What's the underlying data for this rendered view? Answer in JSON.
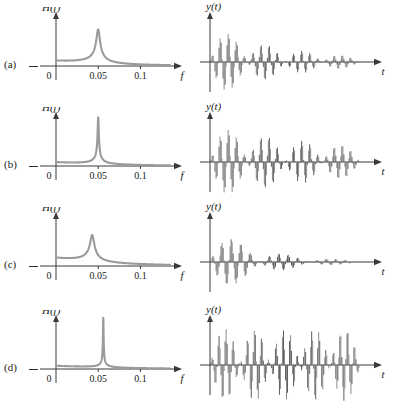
{
  "figure": {
    "row_labels": [
      "(a)",
      "(b)",
      "(c)",
      "(d)"
    ],
    "left_axis": {
      "y_label": "H(f)",
      "x_label": "f",
      "ticks": [
        {
          "value": 0,
          "label": "0"
        },
        {
          "value": 0.05,
          "label": "0.05"
        },
        {
          "value": 0.1,
          "label": "0.1"
        }
      ],
      "xlim": [
        0,
        0.135
      ]
    },
    "right_axis": {
      "y_label": "y(t)",
      "x_label": "t",
      "ticks": []
    }
  },
  "chart_data": [
    {
      "type": "line",
      "panel": "a-left",
      "title": "H(f)",
      "xlabel": "f",
      "ylabel": "H(f)",
      "xlim": [
        0,
        0.135
      ],
      "ylim": [
        0,
        1.15
      ],
      "grid": false,
      "legend": "none",
      "resonance_frequency": 0.05,
      "peak_height": 0.78,
      "peak_sharpness_q": 12,
      "baseline": 0.06,
      "annotation": "moderately sharp resonance peak at f = 0.05"
    },
    {
      "type": "line",
      "panel": "a-right",
      "title": "y(t)",
      "xlabel": "t",
      "ylabel": "y(t)",
      "plot_style": "stem",
      "grid": false,
      "legend": "none",
      "beat_count": 4,
      "decay": "fast",
      "annotation": "damped beating oscillation, amplitude decays over four beats"
    },
    {
      "type": "line",
      "panel": "b-left",
      "title": "H(f)",
      "xlabel": "f",
      "ylabel": "H(f)",
      "xlim": [
        0,
        0.135
      ],
      "ylim": [
        0,
        1.15
      ],
      "grid": false,
      "legend": "none",
      "resonance_frequency": 0.05,
      "peak_height": 1.05,
      "peak_sharpness_q": 38,
      "baseline": 0.06,
      "annotation": "sharp tall resonance peak at f = 0.05, clipped at top of axes"
    },
    {
      "type": "line",
      "panel": "b-right",
      "title": "y(t)",
      "xlabel": "t",
      "ylabel": "y(t)",
      "plot_style": "stem",
      "grid": false,
      "legend": "none",
      "beat_count": 4,
      "decay": "slow",
      "annotation": "lightly damped beating oscillation, slow amplitude decay"
    },
    {
      "type": "line",
      "panel": "c-left",
      "title": "H(f)",
      "xlabel": "f",
      "ylabel": "H(f)",
      "xlim": [
        0,
        0.135
      ],
      "ylim": [
        0,
        1.15
      ],
      "grid": false,
      "legend": "none",
      "resonance_frequency": 0.043,
      "peak_height": 0.62,
      "peak_sharpness_q": 9,
      "baseline": 0.12,
      "annotation": "broad low resonance peak below f = 0.05"
    },
    {
      "type": "line",
      "panel": "c-right",
      "title": "y(t)",
      "xlabel": "t",
      "ylabel": "y(t)",
      "plot_style": "stem",
      "grid": false,
      "legend": "none",
      "beat_count": 3,
      "decay": "very fast",
      "annotation": "heavily damped beating oscillation, decays within three beats"
    },
    {
      "type": "line",
      "panel": "d-left",
      "title": "H(f)",
      "xlabel": "f",
      "ylabel": "H(f)",
      "xlim": [
        0,
        0.135
      ],
      "ylim": [
        0,
        1.15
      ],
      "grid": false,
      "legend": "none",
      "resonance_frequency": 0.056,
      "peak_height": 1.12,
      "peak_sharpness_q": 90,
      "baseline": 0.06,
      "annotation": "very narrow spike resonance just above f = 0.05, clipped at top"
    },
    {
      "type": "line",
      "panel": "d-right",
      "title": "y(t)",
      "xlabel": "t",
      "ylabel": "y(t)",
      "plot_style": "stem",
      "grid": false,
      "legend": "none",
      "beat_count": 5,
      "decay": "none",
      "annotation": "undamped sustained beating oscillation of constant amplitude"
    }
  ],
  "style": {
    "curve_color": "#9a9a9a",
    "stem_color": "#8c8c8c",
    "axis_color": "#3a3a3a",
    "text_color": "#1a1a1a",
    "background": "#ffffff"
  }
}
